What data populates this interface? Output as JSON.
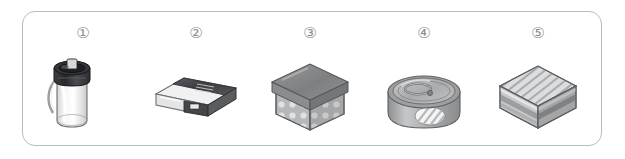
{
  "panel": {
    "border_color": "#b9babc",
    "background_color": "#ffffff"
  },
  "items": [
    {
      "number": "①",
      "name": "thermos-tumbler",
      "label": "Thermos tumbler with dark screw lid and carry strap",
      "colors": {
        "lid": "#3a3a3c",
        "body": "#e6e7e8",
        "outline": "#6e6f71"
      }
    },
    {
      "number": "②",
      "name": "eraser-box",
      "label": "Flat rectangular eraser box with dark paper sleeve",
      "colors": {
        "sleeve": "#4a4b4d",
        "body": "#f0f0f1",
        "outline": "#6e6f71"
      }
    },
    {
      "number": "③",
      "name": "gift-box",
      "label": "Cube gift box with lid and polka dot pattern",
      "colors": {
        "lid": "#7f8183",
        "body": "#bdbfc1",
        "dots": "#e2e3e4",
        "outline": "#5f6062"
      }
    },
    {
      "number": "④",
      "name": "tin-can",
      "label": "Short tin can with pull-tab ring lid",
      "colors": {
        "top": "#b4b6b8",
        "body": "#a9abad",
        "highlight": "#f2f2f3",
        "outline": "#5f6062"
      }
    },
    {
      "number": "⑤",
      "name": "striped-box",
      "label": "Cube package with diagonal stripes on top face",
      "colors": {
        "top": "#d9dadb",
        "front": "#c3c5c7",
        "side": "#9fa1a3",
        "outline": "#5f6062"
      }
    }
  ]
}
